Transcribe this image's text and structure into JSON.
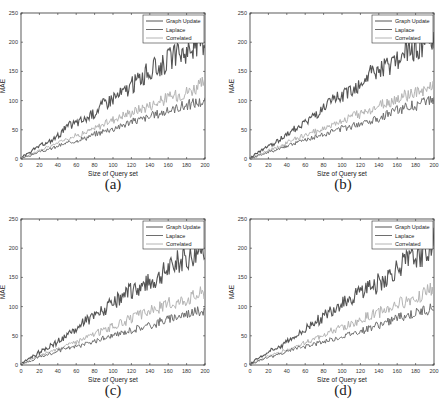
{
  "figure": {
    "panels": [
      {
        "id": "a",
        "caption": "(a)"
      },
      {
        "id": "b",
        "caption": "(b)"
      },
      {
        "id": "c",
        "caption": "(c)"
      },
      {
        "id": "d",
        "caption": "(d)"
      }
    ]
  },
  "series_style": {
    "Graph Update": "#555555",
    "Laplace": "#6e6e6e",
    "Correlated": "#b4b4b4"
  },
  "chart_data": [
    {
      "type": "line",
      "title": "(a)",
      "xlabel": "Size of Query set",
      "ylabel": "MAE",
      "xlim": [
        0,
        200
      ],
      "ylim": [
        0,
        250
      ],
      "xticks": [
        0,
        20,
        40,
        60,
        80,
        100,
        120,
        140,
        160,
        180,
        200
      ],
      "yticks": [
        0,
        50,
        100,
        150,
        200,
        250
      ],
      "grid": false,
      "legend_position": "upper right",
      "x": [
        0,
        10,
        20,
        30,
        40,
        50,
        60,
        70,
        80,
        90,
        100,
        110,
        120,
        130,
        140,
        150,
        160,
        170,
        180,
        190,
        200
      ],
      "series": [
        {
          "name": "Graph Update",
          "values": [
            2,
            12,
            22,
            28,
            40,
            55,
            62,
            68,
            80,
            95,
            105,
            112,
            125,
            140,
            150,
            158,
            170,
            178,
            185,
            195,
            205
          ]
        },
        {
          "name": "Laplace",
          "values": [
            1,
            6,
            12,
            16,
            22,
            27,
            32,
            36,
            42,
            48,
            52,
            58,
            64,
            68,
            72,
            78,
            82,
            88,
            92,
            96,
            98
          ]
        },
        {
          "name": "Correlated",
          "values": [
            1,
            8,
            15,
            20,
            28,
            35,
            40,
            45,
            52,
            60,
            68,
            74,
            80,
            86,
            92,
            98,
            105,
            110,
            115,
            122,
            130
          ]
        }
      ]
    },
    {
      "type": "line",
      "title": "(b)",
      "xlabel": "Size of Query set",
      "ylabel": "MAE",
      "xlim": [
        0,
        200
      ],
      "ylim": [
        0,
        250
      ],
      "xticks": [
        0,
        20,
        40,
        60,
        80,
        100,
        120,
        140,
        160,
        180,
        200
      ],
      "yticks": [
        0,
        50,
        100,
        150,
        200,
        250
      ],
      "grid": false,
      "legend_position": "upper right",
      "x": [
        0,
        10,
        20,
        30,
        40,
        50,
        60,
        70,
        80,
        90,
        100,
        110,
        120,
        130,
        140,
        150,
        160,
        170,
        180,
        190,
        200
      ],
      "series": [
        {
          "name": "Graph Update",
          "values": [
            2,
            12,
            22,
            30,
            42,
            55,
            62,
            75,
            85,
            98,
            108,
            118,
            128,
            145,
            148,
            158,
            170,
            180,
            188,
            198,
            208
          ]
        },
        {
          "name": "Laplace",
          "values": [
            1,
            6,
            12,
            17,
            22,
            28,
            32,
            37,
            42,
            48,
            52,
            57,
            62,
            66,
            70,
            78,
            84,
            88,
            92,
            96,
            102
          ]
        },
        {
          "name": "Correlated",
          "values": [
            1,
            8,
            14,
            20,
            28,
            36,
            40,
            46,
            52,
            60,
            66,
            72,
            78,
            84,
            90,
            96,
            102,
            108,
            112,
            118,
            124
          ]
        }
      ]
    },
    {
      "type": "line",
      "title": "(c)",
      "xlabel": "Size of Query set",
      "ylabel": "MAE",
      "xlim": [
        0,
        200
      ],
      "ylim": [
        0,
        250
      ],
      "xticks": [
        0,
        20,
        40,
        60,
        80,
        100,
        120,
        140,
        160,
        180,
        200
      ],
      "yticks": [
        0,
        50,
        100,
        150,
        200,
        250
      ],
      "grid": false,
      "legend_position": "upper right",
      "x": [
        0,
        10,
        20,
        30,
        40,
        50,
        60,
        70,
        80,
        90,
        100,
        110,
        120,
        130,
        140,
        150,
        160,
        170,
        180,
        190,
        200
      ],
      "series": [
        {
          "name": "Graph Update",
          "values": [
            2,
            12,
            22,
            30,
            40,
            50,
            62,
            75,
            85,
            95,
            105,
            115,
            128,
            135,
            142,
            152,
            165,
            175,
            182,
            192,
            205
          ]
        },
        {
          "name": "Laplace",
          "values": [
            1,
            7,
            14,
            18,
            24,
            28,
            32,
            36,
            40,
            46,
            50,
            55,
            60,
            64,
            68,
            74,
            78,
            84,
            88,
            92,
            94
          ]
        },
        {
          "name": "Correlated",
          "values": [
            1,
            9,
            16,
            22,
            28,
            34,
            40,
            46,
            54,
            60,
            66,
            72,
            80,
            86,
            92,
            98,
            104,
            108,
            114,
            120,
            126
          ]
        }
      ]
    },
    {
      "type": "line",
      "title": "(d)",
      "xlabel": "Size of Query set",
      "ylabel": "MAE",
      "xlim": [
        0,
        200
      ],
      "ylim": [
        0,
        250
      ],
      "xticks": [
        0,
        20,
        40,
        60,
        80,
        100,
        120,
        140,
        160,
        180,
        200
      ],
      "yticks": [
        0,
        50,
        100,
        150,
        200,
        250
      ],
      "grid": false,
      "legend_position": "upper right",
      "x": [
        0,
        10,
        20,
        30,
        40,
        50,
        60,
        70,
        80,
        90,
        100,
        110,
        120,
        130,
        140,
        150,
        160,
        170,
        180,
        190,
        200
      ],
      "series": [
        {
          "name": "Graph Update",
          "values": [
            2,
            12,
            22,
            30,
            40,
            50,
            60,
            75,
            82,
            95,
            108,
            115,
            125,
            135,
            140,
            150,
            165,
            175,
            182,
            195,
            210
          ]
        },
        {
          "name": "Laplace",
          "values": [
            1,
            7,
            13,
            18,
            23,
            28,
            32,
            36,
            40,
            44,
            48,
            54,
            58,
            64,
            68,
            74,
            80,
            84,
            88,
            94,
            98
          ]
        },
        {
          "name": "Correlated",
          "values": [
            1,
            8,
            15,
            20,
            26,
            32,
            38,
            45,
            52,
            58,
            64,
            70,
            76,
            84,
            90,
            96,
            104,
            110,
            116,
            124,
            132
          ]
        }
      ]
    }
  ]
}
